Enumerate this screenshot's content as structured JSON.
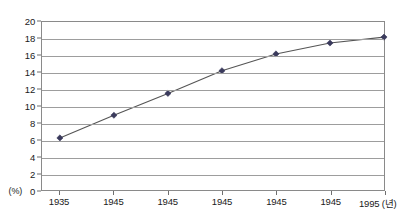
{
  "chart_data": {
    "type": "line",
    "title": "",
    "xlabel": "년",
    "ylabel": "",
    "unit_label": "(%)",
    "x_axis_suffix": "(년)",
    "categories": [
      "1935",
      "1945",
      "1945",
      "1945",
      "1945",
      "1945",
      "1995"
    ],
    "values": [
      6.2,
      8.9,
      11.5,
      14.2,
      16.2,
      17.5,
      18.2
    ],
    "series": [
      {
        "name": "",
        "values": [
          6.2,
          8.9,
          11.5,
          14.2,
          16.2,
          17.5,
          18.2
        ]
      }
    ],
    "ylim": [
      0,
      20
    ],
    "y_ticks": [
      0,
      2,
      4,
      6,
      8,
      10,
      12,
      14,
      16,
      18,
      20
    ],
    "y_tick_labels": [
      "0",
      "2",
      "4",
      "6",
      "8",
      "10",
      "12",
      "14",
      "16",
      "18",
      "20"
    ],
    "grid": true,
    "legend": false,
    "marker": "diamond",
    "line_color": "#555555",
    "marker_color": "#3a3a5c",
    "grid_color": "#9d9d9d",
    "frame_color": "#8a8a8a",
    "background": "#ffffff"
  }
}
